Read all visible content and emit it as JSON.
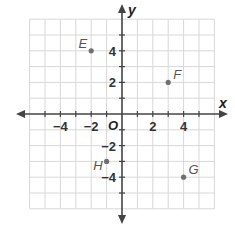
{
  "chart_data": {
    "type": "scatter",
    "title": "",
    "xlabel": "x",
    "ylabel": "y",
    "origin_label": "O",
    "xlim": [
      -6,
      6
    ],
    "ylim": [
      -6,
      6
    ],
    "grid": true,
    "x_tick_labels": [
      {
        "value": -4,
        "label": "−4"
      },
      {
        "value": -2,
        "label": "−2"
      },
      {
        "value": 2,
        "label": "2"
      },
      {
        "value": 4,
        "label": "4"
      }
    ],
    "y_tick_labels": [
      {
        "value": 4,
        "label": "4"
      },
      {
        "value": 2,
        "label": "2"
      },
      {
        "value": -2,
        "label": "−2"
      },
      {
        "value": -4,
        "label": "−4"
      }
    ],
    "points": [
      {
        "name": "E",
        "x": -2,
        "y": 4
      },
      {
        "name": "F",
        "x": 3,
        "y": 2
      },
      {
        "name": "G",
        "x": 4,
        "y": -4
      },
      {
        "name": "H",
        "x": -1,
        "y": -3
      }
    ],
    "colors": {
      "grid": "#d8d8d8",
      "axis": "#444444",
      "point": "#707070"
    }
  }
}
